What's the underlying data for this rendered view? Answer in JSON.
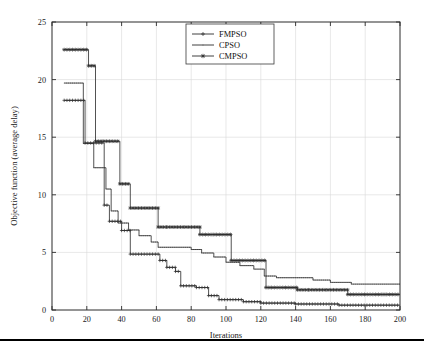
{
  "figure": {
    "background": "#ffffff",
    "line_color": "#333333",
    "grid_color": "#d8d8d8",
    "axis_color": "#2b2b2b"
  },
  "chart_data": {
    "type": "line",
    "title": "",
    "subtitle": "",
    "xlabel": "Iterations",
    "ylabel": "Objective function (average delay)",
    "xlim": [
      0,
      200
    ],
    "ylim": [
      0,
      25
    ],
    "xticks": [
      0,
      20,
      40,
      60,
      80,
      100,
      120,
      140,
      160,
      180,
      200
    ],
    "yticks": [
      0,
      5,
      10,
      15,
      20,
      25
    ],
    "xtick_labels": [
      "0",
      "20",
      "40",
      "60",
      "80",
      "100",
      "120",
      "140",
      "160",
      "180",
      "200"
    ],
    "ytick_labels": [
      "0",
      "5",
      "10",
      "15",
      "20",
      "25"
    ],
    "grid": true,
    "legend_position": "top-center",
    "legend": [
      "FMPSO",
      "CPSO",
      "CMPSO"
    ],
    "drawstyle": "steps-post",
    "series": [
      {
        "name": "FMPSO",
        "marker": "plus",
        "points": [
          [
            7,
            18.2
          ],
          [
            19,
            18.2
          ],
          [
            19,
            14.5
          ],
          [
            30,
            14.5
          ],
          [
            30,
            9.1
          ],
          [
            33,
            9.1
          ],
          [
            33,
            7.7
          ],
          [
            40,
            7.7
          ],
          [
            40,
            6.9
          ],
          [
            45,
            6.9
          ],
          [
            45,
            4.85
          ],
          [
            62,
            4.85
          ],
          [
            62,
            4.3
          ],
          [
            66,
            4.3
          ],
          [
            66,
            3.7
          ],
          [
            71,
            3.7
          ],
          [
            71,
            3.35
          ],
          [
            74,
            3.35
          ],
          [
            74,
            2.1
          ],
          [
            83,
            2.1
          ],
          [
            83,
            1.95
          ],
          [
            90,
            1.95
          ],
          [
            90,
            1.25
          ],
          [
            96,
            1.25
          ],
          [
            96,
            0.9
          ],
          [
            110,
            0.9
          ],
          [
            110,
            0.72
          ],
          [
            120,
            0.72
          ],
          [
            120,
            0.6
          ],
          [
            140,
            0.6
          ],
          [
            140,
            0.52
          ],
          [
            165,
            0.52
          ],
          [
            165,
            0.42
          ],
          [
            200,
            0.42
          ]
        ]
      },
      {
        "name": "CPSO",
        "marker": "dot",
        "points": [
          [
            7,
            19.7
          ],
          [
            18,
            19.7
          ],
          [
            18,
            14.45
          ],
          [
            24,
            14.45
          ],
          [
            24,
            12.35
          ],
          [
            31,
            12.35
          ],
          [
            31,
            10.5
          ],
          [
            34,
            10.5
          ],
          [
            34,
            8.6
          ],
          [
            38,
            8.6
          ],
          [
            38,
            7.55
          ],
          [
            44,
            7.55
          ],
          [
            44,
            6.95
          ],
          [
            50,
            6.95
          ],
          [
            50,
            6.45
          ],
          [
            57,
            6.45
          ],
          [
            57,
            5.9
          ],
          [
            61,
            5.9
          ],
          [
            61,
            5.45
          ],
          [
            80,
            5.45
          ],
          [
            80,
            5.25
          ],
          [
            86,
            5.25
          ],
          [
            86,
            4.95
          ],
          [
            93,
            4.95
          ],
          [
            93,
            4.6
          ],
          [
            100,
            4.6
          ],
          [
            100,
            4.15
          ],
          [
            108,
            4.15
          ],
          [
            108,
            3.85
          ],
          [
            116,
            3.85
          ],
          [
            116,
            3.55
          ],
          [
            122,
            3.55
          ],
          [
            122,
            2.95
          ],
          [
            129,
            2.95
          ],
          [
            129,
            2.8
          ],
          [
            150,
            2.8
          ],
          [
            150,
            2.6
          ],
          [
            160,
            2.6
          ],
          [
            160,
            2.4
          ],
          [
            172,
            2.4
          ],
          [
            172,
            2.25
          ],
          [
            200,
            2.25
          ]
        ]
      },
      {
        "name": "CMPSO",
        "marker": "asterisk",
        "points": [
          [
            7,
            22.6
          ],
          [
            21,
            22.6
          ],
          [
            21,
            21.2
          ],
          [
            25,
            21.2
          ],
          [
            25,
            14.65
          ],
          [
            39,
            14.65
          ],
          [
            39,
            10.95
          ],
          [
            45,
            10.95
          ],
          [
            45,
            8.85
          ],
          [
            61,
            8.85
          ],
          [
            61,
            7.2
          ],
          [
            85,
            7.2
          ],
          [
            85,
            6.55
          ],
          [
            103,
            6.55
          ],
          [
            103,
            4.3
          ],
          [
            123,
            4.3
          ],
          [
            123,
            1.95
          ],
          [
            141,
            1.95
          ],
          [
            141,
            1.75
          ],
          [
            170,
            1.75
          ],
          [
            170,
            1.35
          ],
          [
            200,
            1.35
          ]
        ]
      }
    ]
  },
  "legend_entries": [
    {
      "label": "FMPSO",
      "marker": "plus"
    },
    {
      "label": "CPSO",
      "marker": "dot"
    },
    {
      "label": "CMPSO",
      "marker": "asterisk"
    }
  ],
  "page": {
    "rule_visible": true
  }
}
